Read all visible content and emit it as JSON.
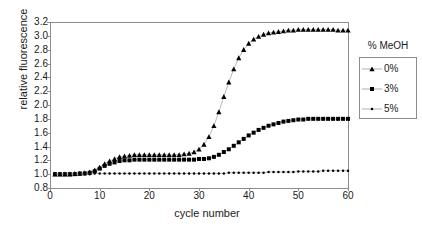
{
  "chart_data": {
    "type": "line",
    "title": "",
    "xlabel": "cycle number",
    "ylabel": "relative fluorescence",
    "xlim": [
      0,
      60
    ],
    "ylim": [
      0.8,
      3.2
    ],
    "xticks": [
      0,
      10,
      20,
      30,
      40,
      50,
      60
    ],
    "yticks": [
      0.8,
      1.0,
      1.2,
      1.4,
      1.6,
      1.8,
      2.0,
      2.2,
      2.4,
      2.6,
      2.8,
      3.0,
      3.2
    ],
    "grid": false,
    "legend_position": "right",
    "legend_title": "% MeOH",
    "x": [
      1,
      2,
      3,
      4,
      5,
      6,
      7,
      8,
      9,
      10,
      11,
      12,
      13,
      14,
      15,
      16,
      17,
      18,
      19,
      20,
      21,
      22,
      23,
      24,
      25,
      26,
      27,
      28,
      29,
      30,
      31,
      32,
      33,
      34,
      35,
      36,
      37,
      38,
      39,
      40,
      41,
      42,
      43,
      44,
      45,
      46,
      47,
      48,
      49,
      50,
      51,
      52,
      53,
      54,
      55,
      56,
      57,
      58,
      59,
      60
    ],
    "series": [
      {
        "name": "0%",
        "marker": "triangle",
        "color": "#000000",
        "values": [
          1.0,
          1.0,
          1.0,
          1.0,
          1.01,
          1.01,
          1.02,
          1.03,
          1.06,
          1.1,
          1.15,
          1.19,
          1.22,
          1.25,
          1.26,
          1.27,
          1.28,
          1.28,
          1.28,
          1.28,
          1.28,
          1.28,
          1.28,
          1.28,
          1.28,
          1.28,
          1.29,
          1.3,
          1.32,
          1.36,
          1.43,
          1.54,
          1.7,
          1.9,
          2.12,
          2.33,
          2.52,
          2.68,
          2.8,
          2.89,
          2.95,
          2.99,
          3.02,
          3.04,
          3.05,
          3.06,
          3.07,
          3.08,
          3.08,
          3.09,
          3.09,
          3.09,
          3.09,
          3.09,
          3.09,
          3.09,
          3.09,
          3.08,
          3.08,
          3.08
        ]
      },
      {
        "name": "3%",
        "marker": "square",
        "color": "#000000",
        "values": [
          1.0,
          1.0,
          1.0,
          1.0,
          1.0,
          1.01,
          1.01,
          1.02,
          1.04,
          1.08,
          1.12,
          1.15,
          1.17,
          1.19,
          1.2,
          1.2,
          1.21,
          1.21,
          1.21,
          1.21,
          1.21,
          1.21,
          1.21,
          1.21,
          1.21,
          1.21,
          1.21,
          1.21,
          1.21,
          1.22,
          1.22,
          1.23,
          1.25,
          1.28,
          1.32,
          1.36,
          1.41,
          1.46,
          1.51,
          1.56,
          1.6,
          1.64,
          1.67,
          1.7,
          1.72,
          1.74,
          1.76,
          1.77,
          1.78,
          1.79,
          1.79,
          1.8,
          1.8,
          1.8,
          1.8,
          1.8,
          1.8,
          1.8,
          1.8,
          1.8
        ]
      },
      {
        "name": "5%",
        "marker": "dot",
        "color": "#000000",
        "values": [
          1.0,
          1.0,
          1.0,
          1.0,
          1.0,
          1.0,
          1.0,
          1.0,
          1.01,
          1.01,
          1.01,
          1.01,
          1.01,
          1.01,
          1.01,
          1.01,
          1.01,
          1.01,
          1.01,
          1.01,
          1.01,
          1.01,
          1.01,
          1.01,
          1.01,
          1.01,
          1.01,
          1.01,
          1.01,
          1.01,
          1.01,
          1.01,
          1.01,
          1.01,
          1.01,
          1.02,
          1.02,
          1.02,
          1.02,
          1.02,
          1.02,
          1.02,
          1.02,
          1.03,
          1.03,
          1.03,
          1.03,
          1.03,
          1.03,
          1.04,
          1.04,
          1.04,
          1.04,
          1.04,
          1.05,
          1.05,
          1.05,
          1.05,
          1.05,
          1.05
        ]
      }
    ]
  },
  "axes": {
    "ylabel": "relative fluorescence",
    "xlabel": "cycle number",
    "yticks": [
      "3.2",
      "3.0",
      "2.8",
      "2.6",
      "2.4",
      "2.2",
      "2.0",
      "1.8",
      "1.6",
      "1.4",
      "1.2",
      "1.0",
      "0.8"
    ],
    "xticks": [
      "0",
      "10",
      "20",
      "30",
      "40",
      "50",
      "60"
    ]
  },
  "legend": {
    "title": "% MeOH",
    "items": [
      {
        "label": "0%",
        "marker": "triangle-marker"
      },
      {
        "label": "3%",
        "marker": "square-marker"
      },
      {
        "label": "5%",
        "marker": "dot-marker"
      }
    ]
  },
  "colors": {
    "frame": "#8c8c8c",
    "marker": "#000000",
    "line": "#999999",
    "background": "#ffffff"
  }
}
